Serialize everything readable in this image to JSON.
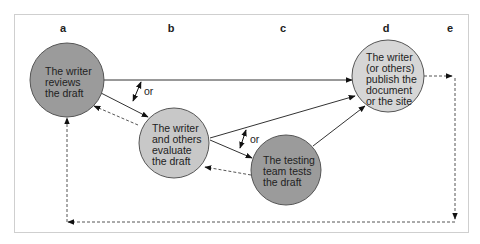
{
  "diagram": {
    "columns": [
      {
        "id": "a",
        "label": "a",
        "x": 63
      },
      {
        "id": "b",
        "label": "b",
        "x": 171
      },
      {
        "id": "c",
        "label": "c",
        "x": 283
      },
      {
        "id": "d",
        "label": "d",
        "x": 386
      },
      {
        "id": "e",
        "label": "e",
        "x": 449
      }
    ],
    "nodes": [
      {
        "id": "review",
        "lines": [
          "The writer",
          "reviews",
          "the draft"
        ],
        "color": "#9b9b9b"
      },
      {
        "id": "evaluate",
        "lines": [
          "The writer",
          "and others",
          "evaluate",
          "the draft"
        ],
        "color": "#c8c8c8"
      },
      {
        "id": "test",
        "lines": [
          "The testing",
          "team tests",
          "the draft"
        ],
        "color": "#9b9b9b"
      },
      {
        "id": "publish",
        "lines": [
          "The writer",
          "(or others)",
          "publish the",
          "document",
          "or the site"
        ],
        "color": "#d6d6d6"
      }
    ],
    "or_labels": [
      "or",
      "or"
    ],
    "edges": [
      {
        "from": "review",
        "to": "publish",
        "style": "solid"
      },
      {
        "from": "review",
        "to": "evaluate",
        "style": "solid"
      },
      {
        "from": "evaluate",
        "to": "review",
        "style": "dashed"
      },
      {
        "from": "evaluate",
        "to": "publish",
        "style": "solid"
      },
      {
        "from": "evaluate",
        "to": "test",
        "style": "solid"
      },
      {
        "from": "test",
        "to": "evaluate",
        "style": "dashed"
      },
      {
        "from": "test",
        "to": "publish",
        "style": "solid"
      },
      {
        "from": "publish",
        "to": "review",
        "style": "dashed",
        "via": "e-column loop"
      }
    ]
  }
}
